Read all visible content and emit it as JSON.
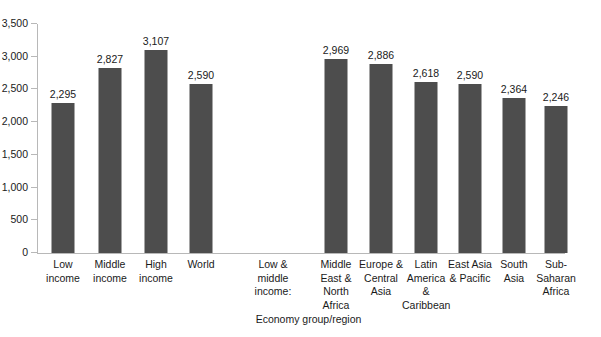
{
  "chart_data": {
    "type": "bar",
    "title": "",
    "subtitle": "",
    "xlabel": "Economy group/region",
    "ylabel": "",
    "ylim": [
      0,
      3500
    ],
    "ytick_step": 500,
    "grid": false,
    "legend": null,
    "bar_color": "#4d4d4d",
    "axis_color": "#b8b8b8",
    "text_color": "#1a1a1a",
    "background": "#ffffff",
    "ytick_labels": [
      "3,500",
      "3,000",
      "2,500",
      "2,000",
      "1,500",
      "1,000",
      "500",
      "0"
    ],
    "ytick_values": [
      3500,
      3000,
      2500,
      2000,
      1500,
      1000,
      500,
      0
    ],
    "categories": [
      "Low income",
      "Middle income",
      "High income",
      "World",
      "Low & middle income:",
      "Middle East & North Africa",
      "Europe & Central Asia",
      "Latin America & Caribbean",
      "East Asia & Pacific",
      "South Asia",
      "Sub-Saharan Africa"
    ],
    "category_label_lines": [
      [
        "Low",
        "income"
      ],
      [
        "Middle",
        "income"
      ],
      [
        "High",
        "income"
      ],
      [
        "World"
      ],
      [
        "Low &",
        "middle",
        "income:"
      ],
      [
        "Middle",
        "East &",
        "North",
        "Africa"
      ],
      [
        "Europe &",
        "Central",
        "Asia"
      ],
      [
        "Latin",
        "America &",
        "Caribbean"
      ],
      [
        "East Asia",
        "& Pacific"
      ],
      [
        "South Asia"
      ],
      [
        "Sub-",
        "Saharan",
        "Africa"
      ]
    ],
    "values": [
      2295,
      2827,
      3107,
      2590,
      null,
      2969,
      2886,
      2618,
      2590,
      2364,
      2246
    ],
    "value_labels": [
      "2,295",
      "2,827",
      "3,107",
      "2,590",
      "",
      "2,969",
      "2,886",
      "2,618",
      "2,590",
      "2,364",
      "2,246"
    ]
  }
}
